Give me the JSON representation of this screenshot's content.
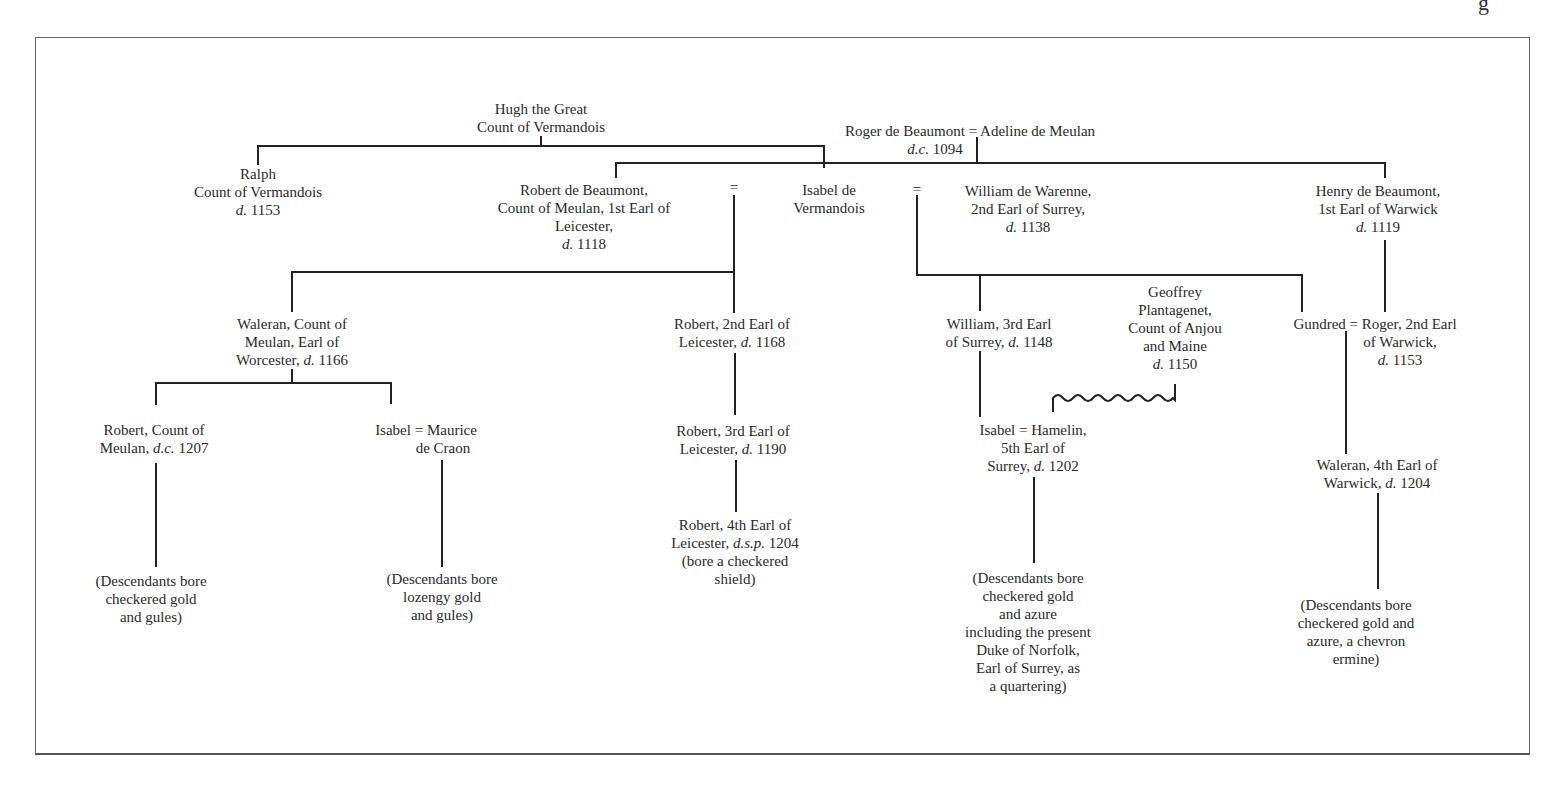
{
  "corner_glyph": "g",
  "nodes": {
    "hugh": {
      "l1": "Hugh the Great",
      "l2": "Count of Vermandois"
    },
    "roger": {
      "name": "Roger de Beaumont",
      "eq": "=",
      "spouse": "Adeline de Meulan",
      "d_prefix": "d.c.",
      "year": "1094"
    },
    "ralph": {
      "l1": "Ralph",
      "l2": "Count of Vermandois",
      "d_prefix": "d.",
      "year": "1153"
    },
    "robert_beaumont": {
      "l1": "Robert de Beaumont,",
      "l2": "Count of Meulan, 1st Earl of",
      "l3": "Leicester,",
      "d_prefix": "d.",
      "year": "1118"
    },
    "isabel_vermandois": {
      "l1": "Isabel de",
      "l2": "Vermandois"
    },
    "william_warenne": {
      "l1": "William de Warenne,",
      "l2": "2nd Earl of Surrey,",
      "d_prefix": "d.",
      "year": "1138"
    },
    "henry_beaumont": {
      "l1": "Henry de Beaumont,",
      "l2": "1st Earl of Warwick",
      "d_prefix": "d.",
      "year": "1119"
    },
    "waleran_meulan": {
      "l1": "Waleran, Count of",
      "l2": "Meulan, Earl of",
      "l3_pre": "Worcester,",
      "d_prefix": "d.",
      "year": "1166"
    },
    "robert_2nd_leicester": {
      "l1": "Robert, 2nd Earl of",
      "l2_pre": "Leicester,",
      "d_prefix": "d.",
      "year": "1168"
    },
    "william_3rd_surrey": {
      "l1": "William, 3rd Earl",
      "l2_pre": "of Surrey,",
      "d_prefix": "d.",
      "year": "1148"
    },
    "geoffrey": {
      "l1": "Geoffrey",
      "l2": "Plantagenet,",
      "l3": "Count of Anjou",
      "l4": "and Maine",
      "d_prefix": "d.",
      "year": "1150"
    },
    "gundred_roger": {
      "l1": "Gundred = Roger, 2nd Earl",
      "l2": "of Warwick,",
      "d_prefix": "d.",
      "year": "1153"
    },
    "robert_count_meulan": {
      "l1": "Robert, Count of",
      "l2_pre": "Meulan,",
      "d_prefix": "d.c.",
      "year": "1207"
    },
    "isabel_maurice": {
      "l1": "Isabel = Maurice",
      "l2": "de Craon"
    },
    "robert_3rd_leicester": {
      "l1": "Robert, 3rd Earl of",
      "l2_pre": "Leicester,",
      "d_prefix": "d.",
      "year": "1190"
    },
    "isabel_hamelin": {
      "l1": "Isabel = Hamelin,",
      "l2": "5th Earl of",
      "l3_pre": "Surrey,",
      "d_prefix": "d.",
      "year": "1202"
    },
    "waleran_4th_warwick": {
      "l1": "Waleran, 4th Earl of",
      "l2_pre": "Warwick,",
      "d_prefix": "d.",
      "year": "1204"
    },
    "robert_4th_leicester": {
      "l1": "Robert, 4th Earl of",
      "l2_pre": "Leicester,",
      "d_prefix": "d.s.p.",
      "year": "1204",
      "l3": "(bore a checkered",
      "l4": "shield)"
    },
    "desc_meulan": {
      "l1": "(Descendants bore",
      "l2": "checkered gold",
      "l3": "and gules)"
    },
    "desc_craon": {
      "l1": "(Descendants bore",
      "l2": "lozengy gold",
      "l3": "and gules)"
    },
    "desc_surrey": {
      "l1": "(Descendants bore",
      "l2": "checkered gold",
      "l3": "and azure",
      "l4": "including the present",
      "l5": "Duke of Norfolk,",
      "l6": "Earl of Surrey, as",
      "l7": "a quartering)"
    },
    "desc_warwick": {
      "l1": "(Descendants bore",
      "l2": "checkered gold and",
      "l3": "azure, a chevron",
      "l4": "ermine)"
    }
  },
  "marriage_symbols": {
    "robert_isabel": "=",
    "isabel_william": "="
  }
}
